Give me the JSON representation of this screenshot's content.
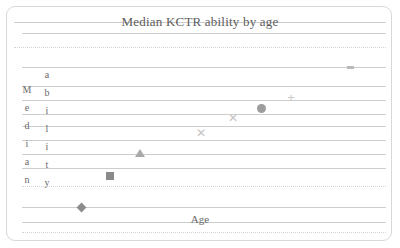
{
  "chart_data": {
    "type": "scatter",
    "title": "Median KCTR ability by age",
    "xlabel": "Age",
    "ylabel": "Median ability",
    "ylabel_letters_left": [
      "M",
      "e",
      "d",
      "i",
      "a",
      "n"
    ],
    "ylabel_letters_right": [
      "a",
      "b",
      "i",
      "l",
      "i",
      "t",
      "y"
    ],
    "grid": true,
    "legend_position": "none",
    "xlim": [
      0,
      400
    ],
    "ylim": [
      0,
      248
    ],
    "axis_tick_labels": [],
    "series": [
      {
        "name": "diamond",
        "marker": "diamond",
        "color": "#8c8c8c",
        "x": 81,
        "y": 207
      },
      {
        "name": "square",
        "marker": "square",
        "color": "#8a8a8a",
        "x": 110,
        "y": 176
      },
      {
        "name": "triangle",
        "marker": "triangle",
        "color": "#a9a9a9",
        "x": 140,
        "y": 153
      },
      {
        "name": "cross-1",
        "marker": "x",
        "color": "#c4c4c4",
        "x": 201,
        "y": 133
      },
      {
        "name": "cross-2",
        "marker": "x",
        "color": "#c4c4c4",
        "x": 233,
        "y": 118
      },
      {
        "name": "circle",
        "marker": "circle",
        "color": "#9d9d9d",
        "x": 261,
        "y": 108
      },
      {
        "name": "plus",
        "marker": "plus",
        "color": "#c9c9c9",
        "x": 291,
        "y": 97
      },
      {
        "name": "dash",
        "marker": "dash",
        "color": "#b9b9b9",
        "x": 350,
        "y": 67
      }
    ],
    "gridlines": [
      {
        "y": 22,
        "style": "solid",
        "left": 14,
        "right": 386
      },
      {
        "y": 33,
        "style": "solid",
        "left": 22,
        "right": 386
      },
      {
        "y": 47,
        "style": "dotted",
        "left": 14,
        "right": 386
      },
      {
        "y": 67,
        "style": "solid",
        "left": 22,
        "right": 386
      },
      {
        "y": 86,
        "style": "solid",
        "left": 22,
        "right": 386
      },
      {
        "y": 100,
        "style": "solid",
        "left": 22,
        "right": 386
      },
      {
        "y": 114,
        "style": "solid",
        "left": 22,
        "right": 386
      },
      {
        "y": 126,
        "style": "solid",
        "left": 22,
        "right": 386
      },
      {
        "y": 140,
        "style": "solid",
        "left": 22,
        "right": 386
      },
      {
        "y": 154,
        "style": "solid",
        "left": 22,
        "right": 386
      },
      {
        "y": 168,
        "style": "solid",
        "left": 22,
        "right": 386
      },
      {
        "y": 186,
        "style": "dotted",
        "left": 22,
        "right": 386
      },
      {
        "y": 207,
        "style": "solid",
        "left": 22,
        "right": 386
      },
      {
        "y": 222,
        "style": "solid",
        "left": 22,
        "right": 386
      },
      {
        "y": 232,
        "style": "dotted",
        "left": 22,
        "right": 386
      }
    ],
    "marker_colors": {
      "diamond": "#8c8c8c",
      "square": "#8a8a8a",
      "triangle": "#a9a9a9",
      "circle": "#9d9d9d",
      "x": "#c4c4c4",
      "plus": "#c9c9c9",
      "dash": "#b9b9b9"
    },
    "glyphs": {
      "x": "✕",
      "plus": "+"
    }
  }
}
